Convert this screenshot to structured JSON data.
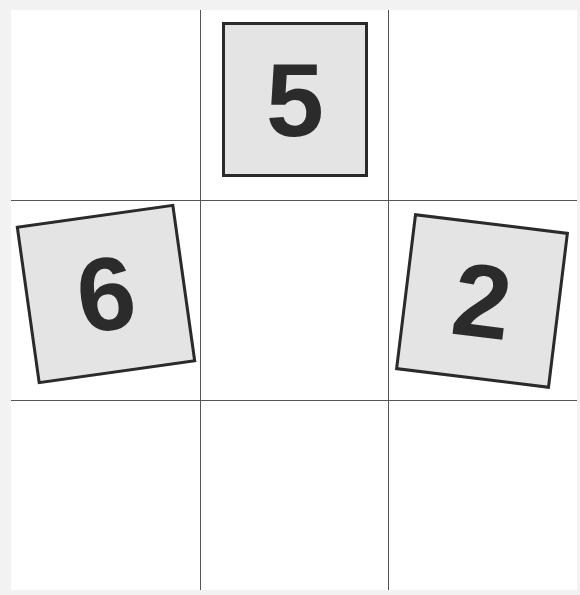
{
  "grid": {
    "rows": 3,
    "cols": 3,
    "line_color": "#555555",
    "background": "#ffffff"
  },
  "cards": [
    {
      "position": "row1-col2",
      "value": "5",
      "rotation_deg": 0
    },
    {
      "position": "row2-col1",
      "value": "6",
      "rotation_deg": -8
    },
    {
      "position": "row2-col3",
      "value": "2",
      "rotation_deg": 7
    }
  ],
  "colors": {
    "card_fill": "#e4e4e4",
    "card_border": "#2a2a2a",
    "digit": "#2b2b2b"
  }
}
